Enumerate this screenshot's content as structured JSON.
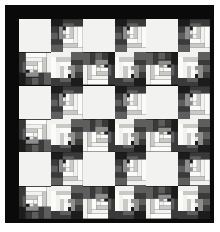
{
  "artwork": {
    "kind": "quilt-photograph",
    "pattern_name": "Log Cabin",
    "setting_name": "Barn Raising / Diamond",
    "grid": {
      "columns": 6,
      "rows": 6
    },
    "background_color": "#ffffff",
    "border_color": "#0a0a0a",
    "border_width_px": 9,
    "palette": {
      "black": "#0a0a0a",
      "dark_charcoal": "#1c1c1c",
      "dark_gray": "#3a3a3a",
      "mid_gray": "#5e5e5e",
      "light_gray": "#8e8e8e",
      "pale_gray": "#c9c9c6",
      "off_white": "#f2f2f0",
      "white": "#fbfbfa"
    },
    "canvas": {
      "width_px": 220,
      "height_px": 232
    },
    "field": {
      "left_px": 14,
      "top_px": 14,
      "width_px": 191,
      "height_px": 200
    }
  },
  "blocks": [
    {
      "r": 0,
      "c": 0,
      "type": "plain"
    },
    {
      "r": 0,
      "c": 1,
      "type": "logcabin",
      "rot": 180
    },
    {
      "r": 0,
      "c": 2,
      "type": "plain"
    },
    {
      "r": 0,
      "c": 3,
      "type": "logcabin",
      "rot": 180
    },
    {
      "r": 0,
      "c": 4,
      "type": "plain"
    },
    {
      "r": 0,
      "c": 5,
      "type": "logcabin",
      "rot": 180
    },
    {
      "r": 1,
      "c": 0,
      "type": "logcabin",
      "rot": 90
    },
    {
      "r": 1,
      "c": 1,
      "type": "logcabin",
      "rot": 0
    },
    {
      "r": 1,
      "c": 2,
      "type": "logcabin",
      "rot": 270
    },
    {
      "r": 1,
      "c": 3,
      "type": "logcabin",
      "rot": 0
    },
    {
      "r": 1,
      "c": 4,
      "type": "logcabin",
      "rot": 270
    },
    {
      "r": 1,
      "c": 5,
      "type": "logcabin",
      "rot": 0
    },
    {
      "r": 2,
      "c": 0,
      "type": "plain"
    },
    {
      "r": 2,
      "c": 1,
      "type": "logcabin",
      "rot": 180
    },
    {
      "r": 2,
      "c": 2,
      "type": "plain"
    },
    {
      "r": 2,
      "c": 3,
      "type": "logcabin",
      "rot": 180
    },
    {
      "r": 2,
      "c": 4,
      "type": "plain"
    },
    {
      "r": 2,
      "c": 5,
      "type": "logcabin",
      "rot": 180
    },
    {
      "r": 3,
      "c": 0,
      "type": "logcabin",
      "rot": 90
    },
    {
      "r": 3,
      "c": 1,
      "type": "logcabin",
      "rot": 0
    },
    {
      "r": 3,
      "c": 2,
      "type": "logcabin",
      "rot": 270
    },
    {
      "r": 3,
      "c": 3,
      "type": "logcabin",
      "rot": 0
    },
    {
      "r": 3,
      "c": 4,
      "type": "logcabin",
      "rot": 270
    },
    {
      "r": 3,
      "c": 5,
      "type": "logcabin",
      "rot": 0
    },
    {
      "r": 4,
      "c": 0,
      "type": "plain"
    },
    {
      "r": 4,
      "c": 1,
      "type": "logcabin",
      "rot": 180
    },
    {
      "r": 4,
      "c": 2,
      "type": "plain"
    },
    {
      "r": 4,
      "c": 3,
      "type": "logcabin",
      "rot": 180
    },
    {
      "r": 4,
      "c": 4,
      "type": "plain"
    },
    {
      "r": 4,
      "c": 5,
      "type": "logcabin",
      "rot": 180
    },
    {
      "r": 5,
      "c": 0,
      "type": "logcabin",
      "rot": 90
    },
    {
      "r": 5,
      "c": 1,
      "type": "logcabin",
      "rot": 0
    },
    {
      "r": 5,
      "c": 2,
      "type": "logcabin",
      "rot": 270
    },
    {
      "r": 5,
      "c": 3,
      "type": "logcabin",
      "rot": 0
    },
    {
      "r": 5,
      "c": 4,
      "type": "logcabin",
      "rot": 270
    },
    {
      "r": 5,
      "c": 5,
      "type": "logcabin",
      "rot": 0
    }
  ],
  "logcabin_template": {
    "description": "Strips in percent of block. Light half toward one diagonal corner, dark half toward the opposite.",
    "strips": [
      {
        "x": 0,
        "y": 0,
        "w": 100,
        "h": 100,
        "color": "#1c1c1c"
      },
      {
        "x": 0,
        "y": 0,
        "w": 62,
        "h": 15,
        "color": "#f2f2f0"
      },
      {
        "x": 0,
        "y": 15,
        "w": 15,
        "h": 62,
        "color": "#fbfbfa"
      },
      {
        "x": 15,
        "y": 15,
        "w": 47,
        "h": 13,
        "color": "#c9c9c6"
      },
      {
        "x": 15,
        "y": 28,
        "w": 13,
        "h": 49,
        "color": "#f2f2f0"
      },
      {
        "x": 28,
        "y": 28,
        "w": 34,
        "h": 13,
        "color": "#fbfbfa"
      },
      {
        "x": 28,
        "y": 41,
        "w": 13,
        "h": 36,
        "color": "#c9c9c6"
      },
      {
        "x": 41,
        "y": 41,
        "w": 21,
        "h": 12,
        "color": "#f2f2f0"
      },
      {
        "x": 41,
        "y": 53,
        "w": 12,
        "h": 24,
        "color": "#fbfbfa"
      },
      {
        "x": 53,
        "y": 53,
        "w": 9,
        "h": 12,
        "color": "#e6e6e3"
      },
      {
        "x": 62,
        "y": 0,
        "w": 38,
        "h": 23,
        "color": "#5e5e5e"
      },
      {
        "x": 62,
        "y": 23,
        "w": 38,
        "h": 16,
        "color": "#3a3a3a"
      },
      {
        "x": 77,
        "y": 39,
        "w": 23,
        "h": 20,
        "color": "#5e5e5e"
      },
      {
        "x": 62,
        "y": 39,
        "w": 15,
        "h": 38,
        "color": "#8e8e8e"
      },
      {
        "x": 0,
        "y": 77,
        "w": 62,
        "h": 23,
        "color": "#3a3a3a"
      },
      {
        "x": 62,
        "y": 77,
        "w": 38,
        "h": 23,
        "color": "#1c1c1c"
      },
      {
        "x": 77,
        "y": 59,
        "w": 23,
        "h": 18,
        "color": "#3a3a3a"
      },
      {
        "x": 28,
        "y": 77,
        "w": 34,
        "h": 11,
        "color": "#5e5e5e"
      },
      {
        "x": 53,
        "y": 41,
        "w": 9,
        "h": 12,
        "color": "#8e8e8e"
      }
    ]
  }
}
